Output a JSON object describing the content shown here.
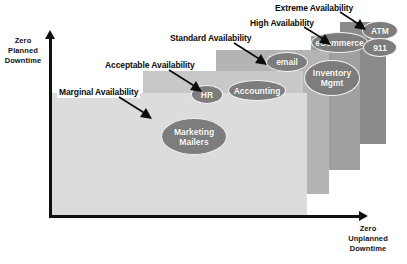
{
  "diagram": {
    "axes": {
      "y_caption": "Zero\nPlanned\nDowntime",
      "y_caption_lines": [
        "Zero",
        "Planned",
        "Downtime"
      ],
      "x_caption_lines": [
        "Zero",
        "Unplanned",
        "Downtime"
      ]
    },
    "colors": {
      "layer_1": "#dcdcdc",
      "layer_2": "#c8c8c8",
      "layer_3": "#b4b4b4",
      "layer_4": "#a0a0a0",
      "layer_5": "#8a8a8a",
      "bubble": "#7d7d7d",
      "bubble_text": "#ffffff",
      "axis": "#111111",
      "label_text": "#0c0c0c",
      "background": "#ffffff"
    },
    "tiers": [
      {
        "id": "marginal",
        "label": "Marginal Availability"
      },
      {
        "id": "acceptable",
        "label": "Acceptable Availability"
      },
      {
        "id": "standard",
        "label": "Standard Availability"
      },
      {
        "id": "high",
        "label": "High Availability"
      },
      {
        "id": "extreme",
        "label": "Extreme Availability"
      }
    ],
    "nodes": [
      {
        "id": "marketing-mailers",
        "label": "Marketing\nMailers",
        "line1": "Marketing",
        "line2": "Mailers"
      },
      {
        "id": "hr",
        "label": "HR",
        "line1": "HR",
        "line2": ""
      },
      {
        "id": "accounting",
        "label": "Accounting",
        "line1": "Accounting",
        "line2": ""
      },
      {
        "id": "email",
        "label": "email",
        "line1": "email",
        "line2": ""
      },
      {
        "id": "inventory-mgmt",
        "label": "Inventory\nMgmt",
        "line1": "Inventory",
        "line2": "Mgmt"
      },
      {
        "id": "ecommerce",
        "label": "eCommerce",
        "line1": "eCommerce",
        "line2": ""
      },
      {
        "id": "atm",
        "label": "ATM",
        "line1": "ATM",
        "line2": ""
      },
      {
        "id": "emergency-911",
        "label": "911",
        "line1": "911",
        "line2": ""
      }
    ]
  }
}
